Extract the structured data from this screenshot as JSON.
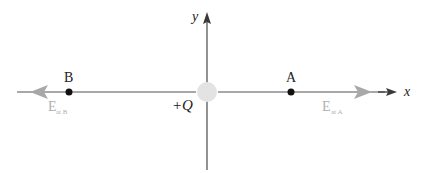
{
  "diagram": {
    "type": "electric-field-point-charge",
    "colors": {
      "background": "#ffffff",
      "axis": "#3a3a3a",
      "field_line": "#a8a8a8",
      "field_arrow": "#a8a8a8",
      "charge_fill": "#e3e3e3",
      "point": "#111111",
      "label": "#222222",
      "field_label": "#b0b0b0"
    },
    "axes": {
      "x_label": "x",
      "y_label": "y"
    },
    "charge": {
      "label": "+Q",
      "position": {
        "x": 207,
        "y": 92
      }
    },
    "points": [
      {
        "id": "A",
        "label": "A",
        "position": {
          "x": 291,
          "y": 92
        }
      },
      {
        "id": "B",
        "label": "B",
        "position": {
          "x": 69,
          "y": 92
        }
      }
    ],
    "field_vectors": [
      {
        "id": "E_at_A",
        "symbol": "E",
        "subscript": "at A",
        "direction": "right"
      },
      {
        "id": "E_at_B",
        "symbol": "E",
        "subscript": "at B",
        "direction": "left"
      }
    ]
  }
}
